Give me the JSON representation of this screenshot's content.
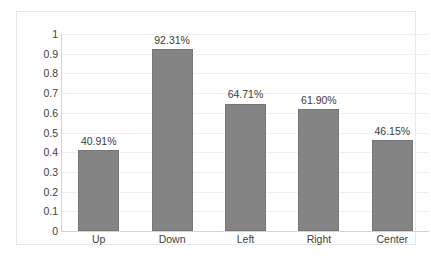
{
  "chart_data": {
    "type": "bar",
    "title": "",
    "subtitle": "",
    "xlabel": "",
    "ylabel": "",
    "categories": [
      "Up",
      "Down",
      "Left",
      "Right",
      "Center"
    ],
    "values": [
      0.4091,
      0.9231,
      0.6471,
      0.619,
      0.4615
    ],
    "data_labels": [
      "40.91%",
      "92.31%",
      "64.71%",
      "61.90%",
      "46.15%"
    ],
    "ylim": [
      0,
      1
    ],
    "ytick_values": [
      0,
      0.1,
      0.2,
      0.3,
      0.4,
      0.5,
      0.6,
      0.7,
      0.8,
      0.9,
      1
    ],
    "ytick_labels": [
      "0",
      "0.1",
      "0.2",
      "0.3",
      "0.4",
      "0.5",
      "0.6",
      "0.7",
      "0.8",
      "0.9",
      "1"
    ],
    "grid": true,
    "legend": false,
    "series": [
      {
        "name": "",
        "values": [
          0.4091,
          0.9231,
          0.6471,
          0.619,
          0.4615
        ]
      }
    ],
    "colors": {
      "bar_fill": "#848484",
      "bar_border": "#767676",
      "gridline": "#f0f0f0",
      "axis_line": "#d4d4d4",
      "frame_border": "#e8e8e8",
      "text": "#404040",
      "background": "#ffffff"
    }
  }
}
